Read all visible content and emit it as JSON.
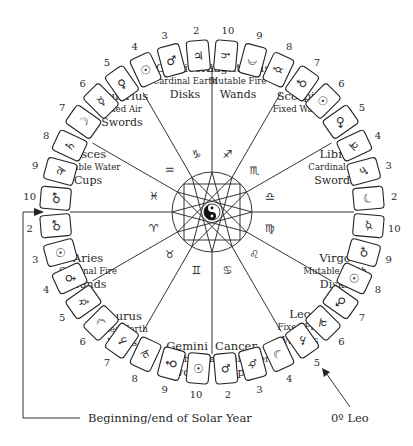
{
  "diagram": {
    "center": {
      "x": 212,
      "y": 212
    },
    "center_icon": "yin-yang-icon",
    "captions": {
      "solar_year": "Beginning/end of Solar Year",
      "leo_marker": "0º Leo"
    },
    "signs": [
      {
        "name": "Capricorn",
        "quality": "Cardinal Earth",
        "suit": "Disks",
        "glyph": "♑",
        "cards": [
          {
            "num": "2",
            "planet": "♃"
          },
          {
            "num": "3",
            "planet": "♂"
          },
          {
            "num": "4",
            "planet": "☉"
          }
        ]
      },
      {
        "name": "Aquarius",
        "quality": "Fixed Air",
        "suit": "Swords",
        "glyph": "♒",
        "cards": [
          {
            "num": "5",
            "planet": "♀"
          },
          {
            "num": "6",
            "planet": "☿"
          },
          {
            "num": "7",
            "planet": "☽"
          }
        ]
      },
      {
        "name": "Pisces",
        "quality": "Mutable Water",
        "suit": "Cups",
        "glyph": "♓",
        "cards": [
          {
            "num": "8",
            "planet": "♄"
          },
          {
            "num": "9",
            "planet": "♃"
          },
          {
            "num": "10",
            "planet": "♂"
          }
        ]
      },
      {
        "name": "Aries",
        "quality": "Cardinal Fire",
        "suit": "Wands",
        "glyph": "♈",
        "cards": [
          {
            "num": "2",
            "planet": "♂"
          },
          {
            "num": "3",
            "planet": "☉"
          },
          {
            "num": "4",
            "planet": "♀"
          }
        ]
      },
      {
        "name": "Taurus",
        "quality": "Fixed Earth",
        "suit": "Disks",
        "glyph": "♉",
        "cards": [
          {
            "num": "5",
            "planet": "☿"
          },
          {
            "num": "6",
            "planet": "☽"
          },
          {
            "num": "7",
            "planet": "♄"
          }
        ]
      },
      {
        "name": "Gemini",
        "quality": "Mutable Air",
        "suit": "Swords",
        "glyph": "♊",
        "cards": [
          {
            "num": "8",
            "planet": "♃"
          },
          {
            "num": "9",
            "planet": "♂"
          },
          {
            "num": "10",
            "planet": "☉"
          }
        ]
      },
      {
        "name": "Cancer",
        "quality": "Cardinal Water",
        "suit": "Cups",
        "glyph": "♋",
        "cards": [
          {
            "num": "2",
            "planet": "♀"
          },
          {
            "num": "3",
            "planet": "☿"
          },
          {
            "num": "4",
            "planet": "☽"
          }
        ]
      },
      {
        "name": "Leo",
        "quality": "Fixed Fire",
        "suit": "Wands",
        "glyph": "♌",
        "cards": [
          {
            "num": "5",
            "planet": "♄"
          },
          {
            "num": "6",
            "planet": "♃"
          },
          {
            "num": "7",
            "planet": "♂"
          }
        ]
      },
      {
        "name": "Virgo",
        "quality": "Mutable Earth",
        "suit": "Disks",
        "glyph": "♍",
        "cards": [
          {
            "num": "8",
            "planet": "☉"
          },
          {
            "num": "9",
            "planet": "♀"
          },
          {
            "num": "10",
            "planet": "☿"
          }
        ]
      },
      {
        "name": "Libra",
        "quality": "Cardinal Air",
        "suit": "Swords",
        "glyph": "♎",
        "cards": [
          {
            "num": "2",
            "planet": "☽"
          },
          {
            "num": "3",
            "planet": "♄"
          },
          {
            "num": "4",
            "planet": "♃"
          }
        ]
      },
      {
        "name": "Scorpio",
        "quality": "Fixed Water",
        "suit": "",
        "glyph": "♏",
        "cards": [
          {
            "num": "5",
            "planet": "♂"
          },
          {
            "num": "6",
            "planet": "☉"
          },
          {
            "num": "7",
            "planet": "♀"
          }
        ]
      },
      {
        "name": "Sagittarius",
        "quality": "Mutable Fire",
        "suit": "Wands",
        "glyph": "♐",
        "cards": [
          {
            "num": "8",
            "planet": "☿"
          },
          {
            "num": "9",
            "planet": "☽"
          },
          {
            "num": "10",
            "planet": "♄"
          }
        ]
      }
    ]
  }
}
